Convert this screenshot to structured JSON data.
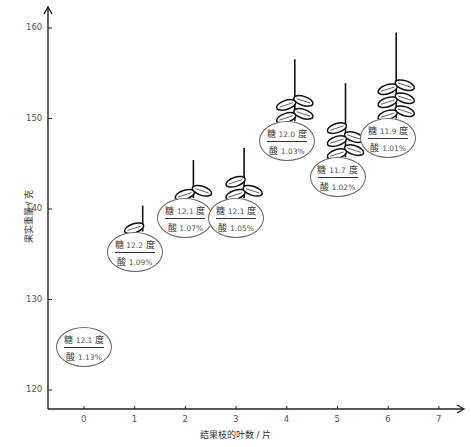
{
  "chart_data": {
    "type": "scatter",
    "title": "",
    "xlabel": "结果枝的叶数 / 片",
    "ylabel": "果实重量 / 克",
    "x_ticks": [
      "0",
      "1",
      "2",
      "3",
      "4",
      "5",
      "6",
      "7"
    ],
    "y_ticks": [
      "120",
      "130",
      "140",
      "150",
      "160"
    ],
    "xlim": [
      -0.7,
      7.3
    ],
    "ylim": [
      118,
      161
    ],
    "grid": false,
    "legend": null,
    "points": [
      {
        "leaves": 0,
        "weight": 124.7,
        "sugar_label": "糖",
        "sugar": "12.1",
        "sugar_unit": "度",
        "acid_label": "酸",
        "acid": "1.13%"
      },
      {
        "leaves": 1,
        "weight": 135.3,
        "sugar_label": "糖",
        "sugar": "12.2",
        "sugar_unit": "度",
        "acid_label": "酸",
        "acid": "1.09%"
      },
      {
        "leaves": 2,
        "weight": 139.0,
        "sugar_label": "糖",
        "sugar": "12.1",
        "sugar_unit": "度",
        "acid_label": "酸",
        "acid": "1.07%"
      },
      {
        "leaves": 3,
        "weight": 139.0,
        "sugar_label": "糖",
        "sugar": "12.1",
        "sugar_unit": "度",
        "acid_label": "酸",
        "acid": "1.05%"
      },
      {
        "leaves": 4,
        "weight": 147.5,
        "sugar_label": "糖",
        "sugar": "12.0",
        "sugar_unit": "度",
        "acid_label": "酸",
        "acid": "1.03%"
      },
      {
        "leaves": 5,
        "weight": 143.5,
        "sugar_label": "糖",
        "sugar": "11.7",
        "sugar_unit": "度",
        "acid_label": "酸",
        "acid": "1.02%"
      },
      {
        "leaves": 6,
        "weight": 147.8,
        "sugar_label": "糖",
        "sugar": "11.9",
        "sugar_unit": "度",
        "acid_label": "酸",
        "acid": "1.01%"
      }
    ]
  }
}
